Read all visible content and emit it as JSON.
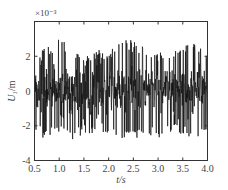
{
  "chart_data": {
    "type": "line",
    "title": "",
    "xlabel": "t/s",
    "ylabel": "U1/m",
    "ylabel_subscript": "1",
    "y_multiplier": "×10⁻³",
    "xlim": [
      0.5,
      4.0
    ],
    "ylim": [
      -4,
      4
    ],
    "x_ticks": [
      0.5,
      1.0,
      1.5,
      2.0,
      2.5,
      3.0,
      3.5,
      4.0
    ],
    "x_tick_labels": [
      "0.5",
      "1.0",
      "1.5",
      "2.0",
      "2.5",
      "3.0",
      "3.5",
      "4.0"
    ],
    "y_ticks": [
      -4,
      -2,
      0,
      2,
      4
    ],
    "y_tick_labels": [
      "-4",
      "-2",
      "0",
      "2",
      ""
    ],
    "grid": false,
    "legend": null,
    "series": [
      {
        "name": "U1",
        "color": "#111111",
        "description": "Dense random-vibration displacement signal, roughly symmetric about 0",
        "approx_range": [
          -3.3,
          3.5
        ],
        "typical_envelope": [
          -1.8,
          1.8
        ],
        "sample_points": {
          "x": [
            0.5,
            0.75,
            1.0,
            1.25,
            1.5,
            1.75,
            2.0,
            2.25,
            2.5,
            2.75,
            3.0,
            3.25,
            3.5,
            3.75,
            4.0
          ],
          "y_max": [
            2.0,
            2.6,
            3.3,
            2.4,
            2.0,
            2.5,
            2.3,
            2.9,
            3.0,
            2.6,
            2.2,
            2.4,
            2.8,
            2.8,
            2.2
          ],
          "y_min": [
            -2.5,
            -2.8,
            -2.6,
            -3.2,
            -2.4,
            -2.5,
            -2.4,
            -2.7,
            -3.0,
            -2.5,
            -2.9,
            -2.4,
            -2.6,
            -2.8,
            -2.4
          ]
        }
      }
    ]
  },
  "render": {
    "seed": 7,
    "samples": 700
  }
}
